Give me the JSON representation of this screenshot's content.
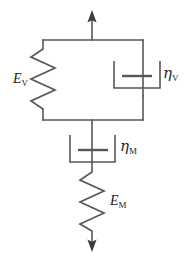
{
  "figure": {
    "name": "viscoelastic-mechanical-model",
    "stroke_color": "#555759",
    "label_color": "#231f20",
    "background_color": "#ffffff"
  },
  "labels": {
    "spring_voigt": {
      "symbol": "E",
      "subscript": "V"
    },
    "dashpot_voigt": {
      "symbol": "η",
      "subscript": "V"
    },
    "dashpot_maxwell": {
      "symbol": "η",
      "subscript": "M"
    },
    "spring_maxwell": {
      "symbol": "E",
      "subscript": "M"
    }
  },
  "elements": [
    {
      "id": "arrow-top",
      "kind": "force-arrow",
      "direction": "up"
    },
    {
      "id": "spring-voigt",
      "kind": "spring",
      "label": "E_V",
      "position": "parallel-left"
    },
    {
      "id": "dashpot-voigt",
      "kind": "dashpot",
      "label": "eta_V",
      "position": "parallel-right"
    },
    {
      "id": "dashpot-maxwell",
      "kind": "dashpot",
      "label": "eta_M",
      "position": "series"
    },
    {
      "id": "spring-maxwell",
      "kind": "spring",
      "label": "E_M",
      "position": "series"
    },
    {
      "id": "arrow-bottom",
      "kind": "force-arrow",
      "direction": "down"
    }
  ]
}
